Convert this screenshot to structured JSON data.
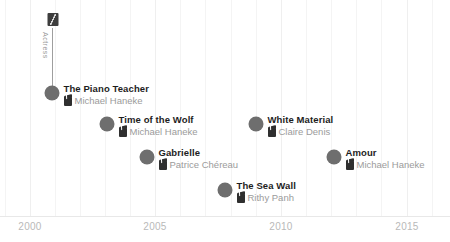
{
  "chart_data": {
    "type": "scatter",
    "title": "",
    "xlabel": "",
    "ylabel": "",
    "xlim": [
      1999.2,
      2016.8
    ],
    "grid": true,
    "legend": null,
    "axis_ticks": [
      {
        "label": "2000",
        "value": 2000,
        "x": 30
      },
      {
        "label": "2005",
        "value": 2005,
        "x": 155
      },
      {
        "label": "2010",
        "value": 2010,
        "x": 281
      },
      {
        "label": "2015",
        "value": 2015,
        "x": 407
      }
    ],
    "gridline_positions": [
      5,
      30,
      55,
      80,
      105,
      130,
      155,
      180,
      205,
      231,
      256,
      281,
      306,
      331,
      356,
      381,
      407,
      432
    ],
    "annotation": {
      "label": "Actress",
      "icon": "person-badge-icon",
      "stem_x": 52,
      "stem_top": 28,
      "stem_bottom": 93
    },
    "point_color": "#6e6e6e",
    "title_color": "#1d1d1d",
    "subtitle_color": "#9b9b9b",
    "gridline_color": "#f4f4f4",
    "points": [
      {
        "title": "The Piano Teacher",
        "director": "Michael Haneke",
        "year": 2001,
        "x": 52,
        "y": 93,
        "r": 7.5,
        "icon": "clapperboard-icon"
      },
      {
        "title": "Time of the Wolf",
        "director": "Michael Haneke",
        "year": 2003,
        "x": 107,
        "y": 124,
        "r": 7.5,
        "icon": "clapperboard-icon"
      },
      {
        "title": "Gabrielle",
        "director": "Patrice Chéreau",
        "year": 2005,
        "x": 147,
        "y": 157,
        "r": 7.5,
        "icon": "clapperboard-icon"
      },
      {
        "title": "The Sea Wall",
        "director": "Rithy Panh",
        "year": 2008,
        "x": 225,
        "y": 190,
        "r": 7.5,
        "icon": "clapperboard-icon"
      },
      {
        "title": "White Material",
        "director": "Claire Denis",
        "year": 2009,
        "x": 256,
        "y": 124,
        "r": 7.5,
        "icon": "clapperboard-icon"
      },
      {
        "title": "Amour",
        "director": "Michael Haneke",
        "year": 2012,
        "x": 334,
        "y": 157,
        "r": 7.5,
        "icon": "clapperboard-icon"
      }
    ]
  }
}
